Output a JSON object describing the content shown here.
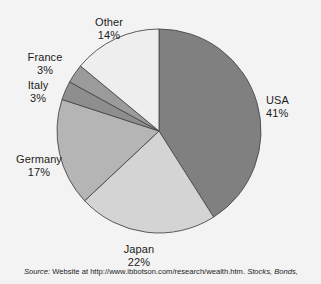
{
  "figure": {
    "background_color": "#f3f3f3",
    "source_prefix": "Source:",
    "source_body": "Website at http://www.ibbotson.com/research/wealth.htm.",
    "source_italic_tail": "Stocks, Bonds,"
  },
  "chart_data": {
    "type": "pie",
    "title": "",
    "xlabel": "",
    "ylabel": "",
    "legend_position": "none",
    "grid": false,
    "start_angle_deg": 90,
    "direction": "clockwise",
    "categories": [
      "USA",
      "Japan",
      "Germany",
      "Italy",
      "France",
      "Other"
    ],
    "values": [
      41,
      22,
      17,
      3,
      3,
      14
    ],
    "unit": "%",
    "total": 100,
    "slices": [
      {
        "label": "USA",
        "value": 41,
        "value_text": "41%",
        "color": "#808080"
      },
      {
        "label": "Japan",
        "value": 22,
        "value_text": "22%",
        "color": "#d4d4d4"
      },
      {
        "label": "Germany",
        "value": 17,
        "value_text": "17%",
        "color": "#b5b5b5"
      },
      {
        "label": "Italy",
        "value": 3,
        "value_text": "3%",
        "color": "#8e8e8e"
      },
      {
        "label": "France",
        "value": 3,
        "value_text": "3%",
        "color": "#9b9b9b"
      },
      {
        "label": "Other",
        "value": 14,
        "value_text": "14%",
        "color": "#eeeeee"
      }
    ],
    "edge_color": "#4a4a4a",
    "geometry": {
      "center_x": 159,
      "center_y": 131,
      "radius": 102
    }
  },
  "labels": {
    "usa": {
      "name": "USA",
      "percent": "41%"
    },
    "japan": {
      "name": "Japan",
      "percent": "22%"
    },
    "germany": {
      "name": "Germany",
      "percent": "17%"
    },
    "italy": {
      "name": "Italy",
      "percent": "3%"
    },
    "france": {
      "name": "France",
      "percent": "3%"
    },
    "other": {
      "name": "Other",
      "percent": "14%"
    }
  }
}
